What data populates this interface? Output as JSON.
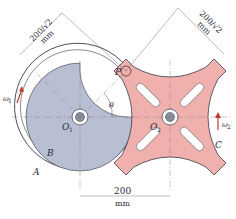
{
  "diagram": {
    "colors": {
      "driver_fill": "#b9bfd3",
      "geneva_fill": "#f0b1ae",
      "outline": "#3a3a48",
      "dim_line": "#555555",
      "arrow": "#c0392b"
    },
    "labels": {
      "pin": "P",
      "angle": "θ",
      "center1": "O",
      "center1_sub": "1",
      "center2": "O",
      "center2_sub": "2",
      "outer_ring": "A",
      "driver_disk": "B",
      "geneva_wheel": "C",
      "omega1": "ω",
      "omega1_sub": "1",
      "omega2": "ω",
      "omega2_sub": "2"
    },
    "dimensions": {
      "left_diag_value": "200/√2",
      "left_diag_unit": "mm",
      "right_diag_value": "200/√2",
      "right_diag_unit": "mm",
      "center_distance_value": "200",
      "center_distance_unit": "mm"
    }
  }
}
